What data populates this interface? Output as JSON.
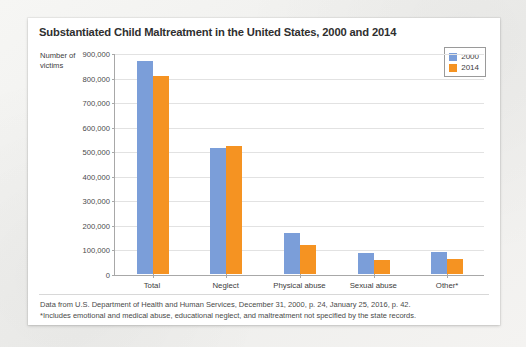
{
  "card": {
    "title": "Substantiated Child Maltreatment in the United States, 2000 and 2014",
    "axis_label_line1": "Number of",
    "axis_label_line2": "victims",
    "footnote_1": "Data from U.S. Department of Health and Human Services, December 31, 2000, p. 24, January 25, 2016, p. 42.",
    "footnote_2": "*Includes emotional and medical abuse, educational neglect, and maltreatment not specified by the state records."
  },
  "legend": {
    "items": [
      {
        "label": "2000",
        "color": "#7b9ed9"
      },
      {
        "label": "2014",
        "color": "#f59322"
      }
    ]
  },
  "chart_data": {
    "type": "bar",
    "title": "Substantiated Child Maltreatment in the United States, 2000 and 2014",
    "xlabel": "",
    "ylabel": "Number of victims",
    "ylim": [
      0,
      900000
    ],
    "yticks": [
      0,
      100000,
      200000,
      300000,
      400000,
      500000,
      600000,
      700000,
      800000,
      900000
    ],
    "ytick_labels": [
      "0",
      "100,000",
      "200,000",
      "300,000",
      "400,000",
      "500,000",
      "600,000",
      "700,000",
      "800,000",
      "900,000"
    ],
    "grid": true,
    "legend_position": "top-right",
    "categories": [
      "Total",
      "Neglect",
      "Physical abuse",
      "Sexual abuse",
      "Other*"
    ],
    "series": [
      {
        "name": "2000",
        "color": "#7b9ed9",
        "values": [
          872000,
          515000,
          167000,
          88000,
          91000
        ]
      },
      {
        "name": "2014",
        "color": "#f59322",
        "values": [
          812000,
          525000,
          118000,
          58000,
          62000
        ]
      }
    ]
  }
}
